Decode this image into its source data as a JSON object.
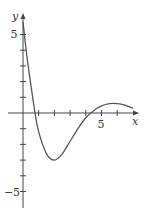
{
  "chart_data": {
    "type": "line",
    "title": "",
    "xlabel": "x",
    "ylabel": "y",
    "xlim": [
      -1,
      7.3
    ],
    "ylim": [
      -6,
      6.3
    ],
    "grid": false,
    "legend": null,
    "x_ticks": [
      1,
      2,
      3,
      4,
      5,
      6
    ],
    "x_tick_labels": [
      {
        "value": 5,
        "label": "5"
      }
    ],
    "y_ticks": [
      -5,
      -4,
      -3,
      -2,
      -1,
      1,
      2,
      3,
      4,
      5
    ],
    "y_tick_labels": [
      {
        "value": 5,
        "label": "5"
      },
      {
        "value": -5,
        "label": "−5"
      }
    ],
    "series": [
      {
        "name": "curve",
        "x": [
          0,
          0.25,
          0.5,
          0.75,
          1,
          1.5,
          2,
          2.5,
          3,
          3.5,
          4,
          4.5,
          5,
          5.5,
          6,
          6.5,
          7
        ],
        "values": [
          5.8,
          3.6,
          1.8,
          0.1,
          -1.2,
          -2.6,
          -3.0,
          -2.6,
          -1.8,
          -1.0,
          -0.3,
          0.15,
          0.45,
          0.6,
          0.6,
          0.5,
          0.3
        ]
      }
    ],
    "color": "#555555"
  },
  "labels": {
    "x_axis": "x",
    "y_axis": "y",
    "tick_5": "5",
    "tick_neg5": "−5",
    "x_tick_5": "5"
  }
}
